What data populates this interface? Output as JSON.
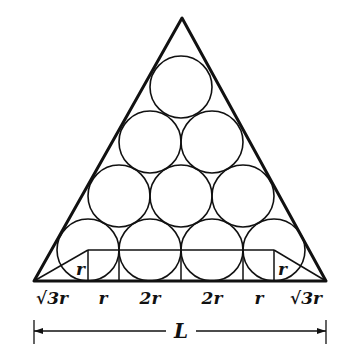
{
  "diagram": {
    "triangle": {
      "apex": [
        182,
        18
      ],
      "left": [
        34,
        281
      ],
      "right": [
        326,
        281
      ]
    },
    "circle_radius": 31,
    "rows": [
      {
        "y": 250,
        "xs": [
          88,
          150,
          212,
          274
        ]
      },
      {
        "y": 196,
        "xs": [
          119,
          181,
          243
        ]
      },
      {
        "y": 142,
        "xs": [
          150,
          212
        ]
      },
      {
        "y": 87,
        "xs": [
          181
        ]
      }
    ],
    "inner_labels": {
      "left_r": "r",
      "right_r": "r"
    },
    "base_segments": [
      {
        "label": "√3r",
        "x": 52
      },
      {
        "label": "r",
        "x": 103
      },
      {
        "label": "2r",
        "x": 150
      },
      {
        "label": "2r",
        "x": 212
      },
      {
        "label": "r",
        "x": 259
      },
      {
        "label": "√3r",
        "x": 306
      }
    ],
    "dimension": {
      "label": "L"
    },
    "line_color": "#111111"
  }
}
